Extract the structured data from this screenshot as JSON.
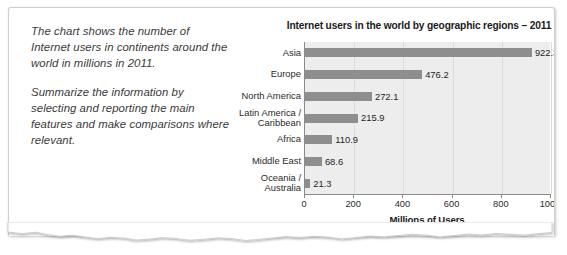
{
  "prompt": {
    "paragraph_1": "The chart shows the number of Internet users in continents around the world in millions in 2011.",
    "paragraph_2": "Summarize the information by selecting and reporting the main features and make comparisons where relevant."
  },
  "chart_data": {
    "type": "bar",
    "orientation": "horizontal",
    "title": "Internet users in the world by geographic regions – 2011",
    "xlabel": "Millions of Users",
    "ylabel": "",
    "categories": [
      "Asia",
      "Europe",
      "North America",
      "Latin America /\nCaribbean",
      "Africa",
      "Middle East",
      "Oceania /\nAustralia"
    ],
    "values": [
      922.3,
      476.2,
      272.1,
      215.9,
      110.9,
      68.6,
      21.3
    ],
    "data_labels": [
      "922.3",
      "476.2",
      "272.1",
      "215.9",
      "110.9",
      "68.6",
      "21.3"
    ],
    "xlim": [
      0,
      1000
    ],
    "xticks": [
      0,
      200,
      400,
      600,
      800,
      1000
    ],
    "xticklabels": [
      "0",
      "200",
      "400",
      "600",
      "800",
      "1000"
    ],
    "grid": "vertical",
    "legend": "none",
    "bar_color": "#8e8e8e",
    "plot_background": "#ededed"
  }
}
